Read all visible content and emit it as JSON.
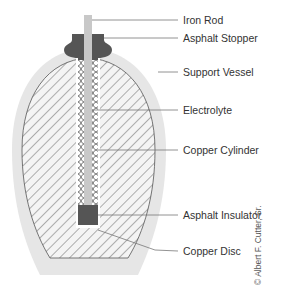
{
  "diagram": {
    "labels": [
      {
        "id": "iron-rod",
        "text": "Iron Rod",
        "y": 20
      },
      {
        "id": "asphalt-stopper",
        "text": "Asphalt Stopper",
        "y": 38
      },
      {
        "id": "support-vessel",
        "text": "Support Vessel",
        "y": 72
      },
      {
        "id": "electrolyte",
        "text": "Electrolyte",
        "y": 110
      },
      {
        "id": "copper-cylinder",
        "text": "Copper Cylinder",
        "y": 150
      },
      {
        "id": "asphalt-insulator",
        "text": "Asphalt Insulator",
        "y": 215
      },
      {
        "id": "copper-disc",
        "text": "Copper Disc",
        "y": 251
      }
    ],
    "credit": "© Albert F. Cutter, Sr.",
    "colors": {
      "vessel": "#e6e6e6",
      "hatch_bg": "#f4f4f4",
      "hatch_line": "#555555",
      "rod": "#c8c8c8",
      "asphalt": "#555555",
      "copper_line": "#666666",
      "leader": "#777777"
    }
  }
}
